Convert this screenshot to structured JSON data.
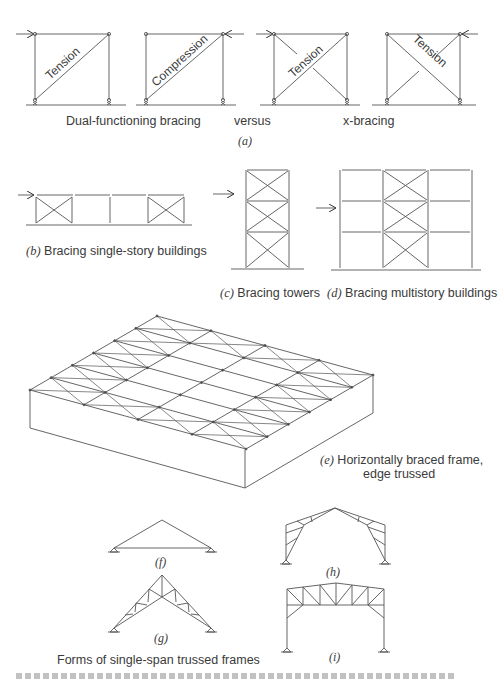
{
  "figure": {
    "a": {
      "panels": [
        {
          "diagonal_label": "Tension",
          "load_side": "left"
        },
        {
          "diagonal_label": "Compression",
          "load_side": "right"
        },
        {
          "diagonal_label": "Tension",
          "load_side": "left",
          "type": "x-bracing"
        },
        {
          "diagonal_label": "Tension",
          "load_side": "right",
          "type": "x-bracing"
        }
      ],
      "caption_left": "Dual-functioning bracing",
      "caption_mid": "versus",
      "caption_right": "x-bracing",
      "letter": "(a)"
    },
    "b": {
      "letter": "(b)",
      "caption": "Bracing single-story buildings"
    },
    "c": {
      "letter": "(c)",
      "caption": "Bracing towers"
    },
    "d": {
      "letter": "(d)",
      "caption": "Bracing multistory buildings"
    },
    "e": {
      "letter": "(e)",
      "caption_line1": "Horizontally braced frame,",
      "caption_line2": "edge trussed"
    },
    "f": {
      "letter": "(f)"
    },
    "g": {
      "letter": "(g)"
    },
    "h": {
      "letter": "(h)"
    },
    "i": {
      "letter": "(i)"
    },
    "group_caption": "Forms of single-span trussed frames"
  },
  "colors": {
    "line": "#4a4a4a",
    "text": "#3a3a3a",
    "background": "#ffffff"
  }
}
